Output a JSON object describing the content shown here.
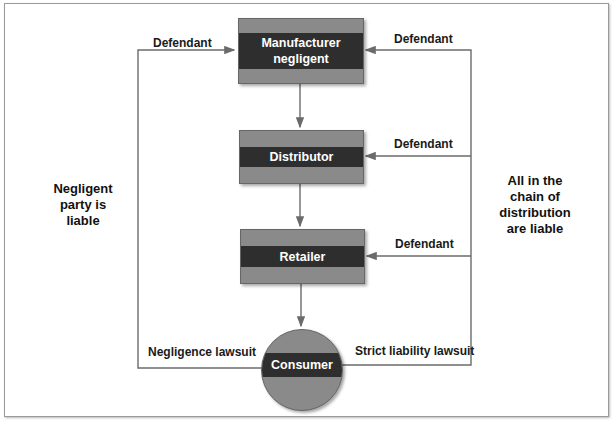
{
  "diagram": {
    "nodes": {
      "manufacturer": "Manufacturer negligent",
      "manufacturer_line1": "Manufacturer",
      "manufacturer_line2": "negligent",
      "distributor": "Distributor",
      "retailer": "Retailer",
      "consumer": "Consumer"
    },
    "edge_labels": {
      "left_defendant": "Defendant",
      "right_defendant_manufacturer": "Defendant",
      "right_defendant_distributor": "Defendant",
      "right_defendant_retailer": "Defendant",
      "negligence_lawsuit": "Negligence lawsuit",
      "strict_liability_lawsuit": "Strict liability lawsuit"
    },
    "side_notes": {
      "left": [
        "Negligent",
        "party is",
        "liable"
      ],
      "right": [
        "All in the",
        "chain of",
        "distribution",
        "are liable"
      ]
    },
    "colors": {
      "box_fill": "#8a8a8a",
      "band_fill": "#2e2e2e",
      "line": "#6b6b6b",
      "text": "#1a1a1a"
    }
  }
}
